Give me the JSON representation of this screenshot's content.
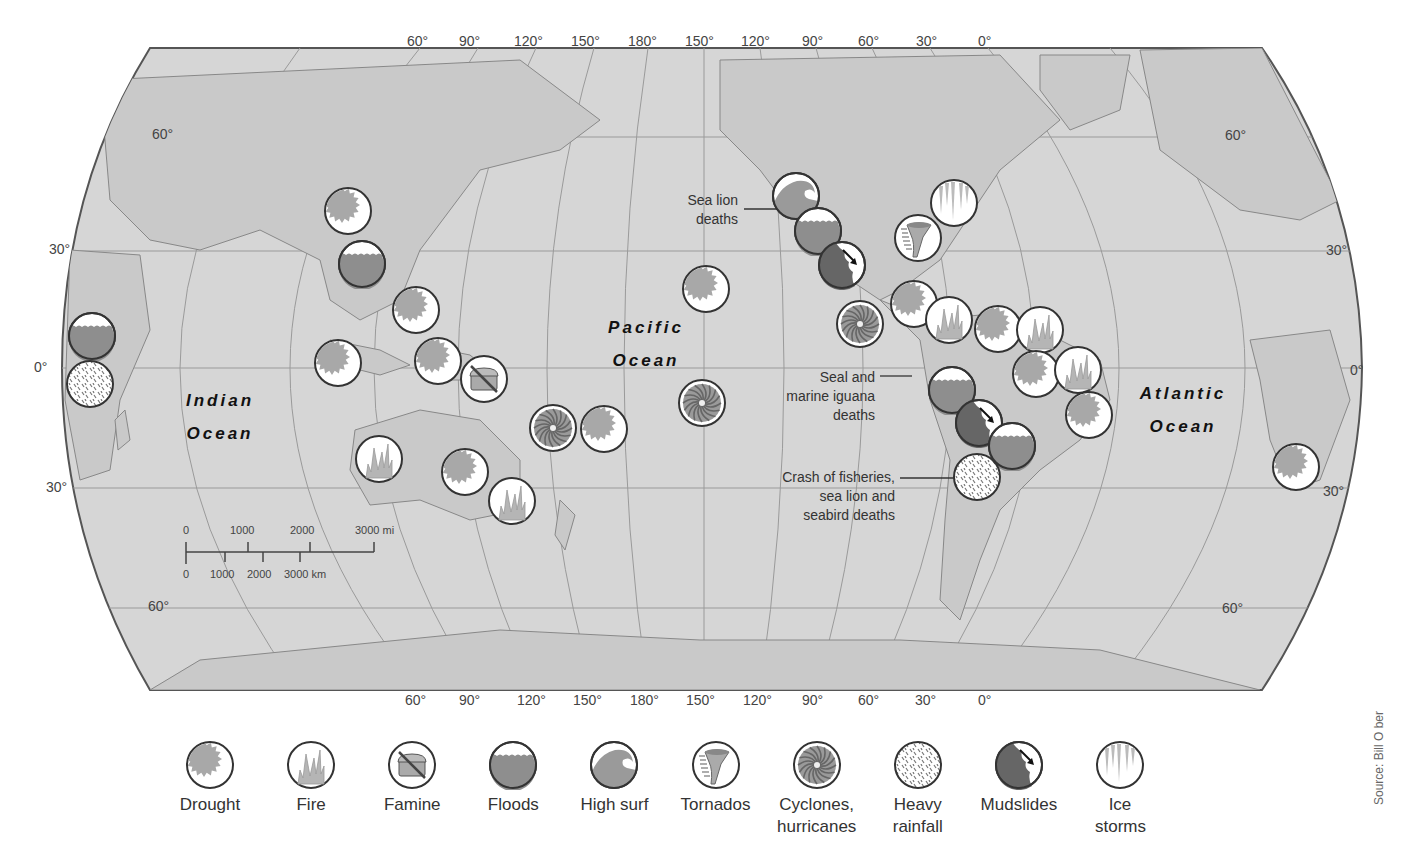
{
  "map": {
    "projection": "Robinson (Pacific-centered)",
    "land_color": "#c8c8c8",
    "ocean_color": "#d9d9d9",
    "top_longitudes": [
      "60°",
      "90°",
      "120°",
      "150°",
      "180°",
      "150°",
      "120°",
      "90°",
      "60°",
      "30°",
      "0°"
    ],
    "bottom_longitudes": [
      "60°",
      "90°",
      "120°",
      "150°",
      "180°",
      "150°",
      "120°",
      "90°",
      "60°",
      "30°",
      "0°"
    ],
    "left_latitudes": [
      "60°",
      "30°",
      "0°",
      "30°",
      "60°"
    ],
    "right_latitudes": [
      "60°",
      "30°",
      "0°",
      "30°",
      "60°"
    ],
    "oceans": [
      {
        "line1": "Indian",
        "line2": "Ocean"
      },
      {
        "line1": "Pacific",
        "line2": "Ocean"
      },
      {
        "line1": "Atlantic",
        "line2": "Ocean"
      }
    ],
    "annotations": [
      {
        "text": "Sea lion deaths",
        "lines": [
          "Sea lion",
          "deaths"
        ]
      },
      {
        "text": "Seal and marine iguana deaths",
        "lines": [
          "Seal and",
          "marine iguana",
          "deaths"
        ]
      },
      {
        "text": "Crash of fisheries, sea lion and seabird deaths",
        "lines": [
          "Crash of fisheries,",
          "sea lion and",
          "seabird deaths"
        ]
      }
    ],
    "scale_bar": {
      "miles": [
        "0",
        "1000",
        "2000",
        "3000 mi"
      ],
      "km": [
        "0",
        "1000",
        "2000",
        "3000 km"
      ]
    },
    "markers": [
      {
        "type": "floods",
        "x": 92,
        "y": 336
      },
      {
        "type": "heavy_rainfall",
        "x": 90,
        "y": 384
      },
      {
        "type": "drought",
        "x": 348,
        "y": 211
      },
      {
        "type": "floods",
        "x": 362,
        "y": 264
      },
      {
        "type": "drought",
        "x": 416,
        "y": 310
      },
      {
        "type": "drought",
        "x": 338,
        "y": 363
      },
      {
        "type": "drought",
        "x": 438,
        "y": 361
      },
      {
        "type": "famine",
        "x": 484,
        "y": 379
      },
      {
        "type": "cyclones",
        "x": 553,
        "y": 428
      },
      {
        "type": "drought",
        "x": 604,
        "y": 429
      },
      {
        "type": "fire",
        "x": 379,
        "y": 459
      },
      {
        "type": "drought",
        "x": 465,
        "y": 472
      },
      {
        "type": "fire",
        "x": 512,
        "y": 501
      },
      {
        "type": "drought",
        "x": 706,
        "y": 289
      },
      {
        "type": "cyclones",
        "x": 702,
        "y": 403
      },
      {
        "type": "high_surf",
        "x": 796,
        "y": 196
      },
      {
        "type": "floods",
        "x": 818,
        "y": 231
      },
      {
        "type": "mudslides",
        "x": 842,
        "y": 265
      },
      {
        "type": "cyclones",
        "x": 860,
        "y": 324
      },
      {
        "type": "ice_storms",
        "x": 954,
        "y": 203
      },
      {
        "type": "tornados",
        "x": 918,
        "y": 238
      },
      {
        "type": "drought",
        "x": 914,
        "y": 304
      },
      {
        "type": "fire",
        "x": 949,
        "y": 320
      },
      {
        "type": "drought",
        "x": 998,
        "y": 329
      },
      {
        "type": "fire",
        "x": 1040,
        "y": 330
      },
      {
        "type": "drought",
        "x": 1036,
        "y": 374
      },
      {
        "type": "fire",
        "x": 1078,
        "y": 370
      },
      {
        "type": "drought",
        "x": 1089,
        "y": 415
      },
      {
        "type": "floods",
        "x": 952,
        "y": 390
      },
      {
        "type": "mudslides",
        "x": 979,
        "y": 423
      },
      {
        "type": "floods",
        "x": 1012,
        "y": 446
      },
      {
        "type": "heavy_rainfall",
        "x": 977,
        "y": 477
      },
      {
        "type": "drought",
        "x": 1296,
        "y": 467
      }
    ]
  },
  "legend": {
    "items": [
      {
        "type": "drought",
        "label": "Drought"
      },
      {
        "type": "fire",
        "label": "Fire"
      },
      {
        "type": "famine",
        "label": "Famine"
      },
      {
        "type": "floods",
        "label": "Floods"
      },
      {
        "type": "high_surf",
        "label": "High surf"
      },
      {
        "type": "tornados",
        "label": "Tornados"
      },
      {
        "type": "cyclones",
        "label": "Cyclones, hurricanes"
      },
      {
        "type": "heavy_rainfall",
        "label": "Heavy rainfall"
      },
      {
        "type": "mudslides",
        "label": "Mudslides"
      },
      {
        "type": "ice_storms",
        "label": "Ice storms"
      }
    ]
  },
  "source": "Source: Bill O ber"
}
